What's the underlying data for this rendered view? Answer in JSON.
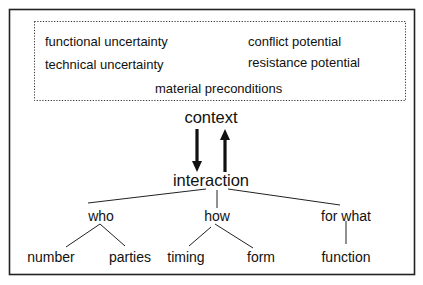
{
  "diagram": {
    "context_factors": {
      "left": [
        "functional uncertainty",
        "technical uncertainty"
      ],
      "right": [
        "conflict potential",
        "resistance potential"
      ],
      "bottom": "material preconditions"
    },
    "context_label": "context",
    "interaction_label": "interaction",
    "branches": [
      {
        "label": "who",
        "children": [
          "number",
          "parties"
        ]
      },
      {
        "label": "how",
        "children": [
          "timing",
          "form"
        ]
      },
      {
        "label": "for what",
        "children": [
          "function"
        ]
      }
    ]
  }
}
